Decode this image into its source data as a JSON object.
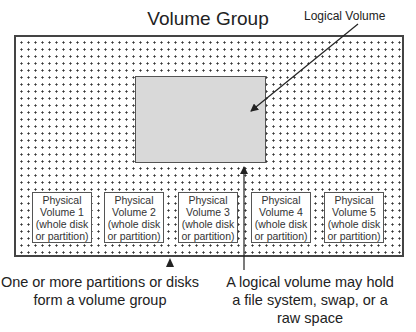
{
  "diagram": {
    "title": "Volume Group",
    "logical_volume_label": "Logical Volume",
    "physical_volumes": [
      {
        "line1": "Physical",
        "line2": "Volume 1",
        "line3": "(whole disk",
        "line4": "or partition)"
      },
      {
        "line1": "Physical",
        "line2": "Volume 2",
        "line3": "(whole disk",
        "line4": "or partition)"
      },
      {
        "line1": "Physical",
        "line2": "Volume 3",
        "line3": "(whole disk",
        "line4": "or partition)"
      },
      {
        "line1": "Physical",
        "line2": "Volume 4",
        "line3": "(whole disk",
        "line4": "or partition)"
      },
      {
        "line1": "Physical",
        "line2": "Volume 5",
        "line3": "(whole disk",
        "line4": "or partition)"
      }
    ],
    "caption_left": {
      "line1": "One or more partitions or disks",
      "line2": "form a volume group"
    },
    "caption_right": {
      "line1": "A logical volume may hold",
      "line2": "a file system, swap, or a",
      "line3": "raw space"
    },
    "colors": {
      "logical_volume_fill": "#d9d9d9",
      "border": "#444444",
      "dots": "#333333"
    }
  }
}
